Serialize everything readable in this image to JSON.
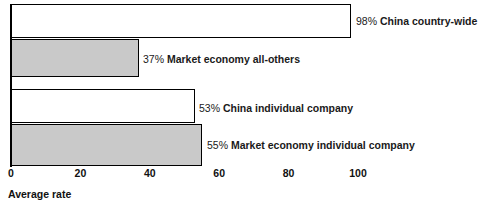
{
  "chart_data": {
    "type": "bar",
    "orientation": "horizontal",
    "title": "",
    "xlabel": "Average rate",
    "ylabel": "",
    "xlim": [
      0,
      112
    ],
    "grid": false,
    "legend": "none",
    "categories": [
      "China country-wide",
      "Market economy all-others",
      "China individual company",
      "Market economy individual company"
    ],
    "values": [
      98,
      37,
      53,
      55
    ],
    "value_labels": [
      "98%",
      "37%",
      "53%",
      "55%"
    ],
    "bar_fills": [
      "#ffffff",
      "#c9c9c9",
      "#ffffff",
      "#c9c9c9"
    ],
    "bar_border_color": "#000000",
    "xticks": [
      0,
      20,
      40,
      60,
      80,
      100
    ],
    "xtick_labels": [
      "0",
      "20",
      "40",
      "60",
      "80",
      "100"
    ],
    "bars": [
      {
        "value": 98,
        "pct": "98%",
        "name": "China country-wide",
        "fill": "#ffffff",
        "top": 4,
        "height": 34,
        "label_left": 356,
        "label_top": 16
      },
      {
        "value": 37,
        "pct": "37%",
        "name": "Market economy all-others",
        "fill": "#c9c9c9",
        "top": 39,
        "height": 38,
        "label_left": 143,
        "label_top": 54
      },
      {
        "value": 53,
        "pct": "53%",
        "name": "China individual company",
        "fill": "#ffffff",
        "top": 89,
        "height": 34,
        "label_left": 199,
        "label_top": 103
      },
      {
        "value": 55,
        "pct": "55%",
        "name": "Market economy individual company",
        "fill": "#c9c9c9",
        "top": 124,
        "height": 42,
        "label_top": 140,
        "label_left": 207
      }
    ]
  }
}
